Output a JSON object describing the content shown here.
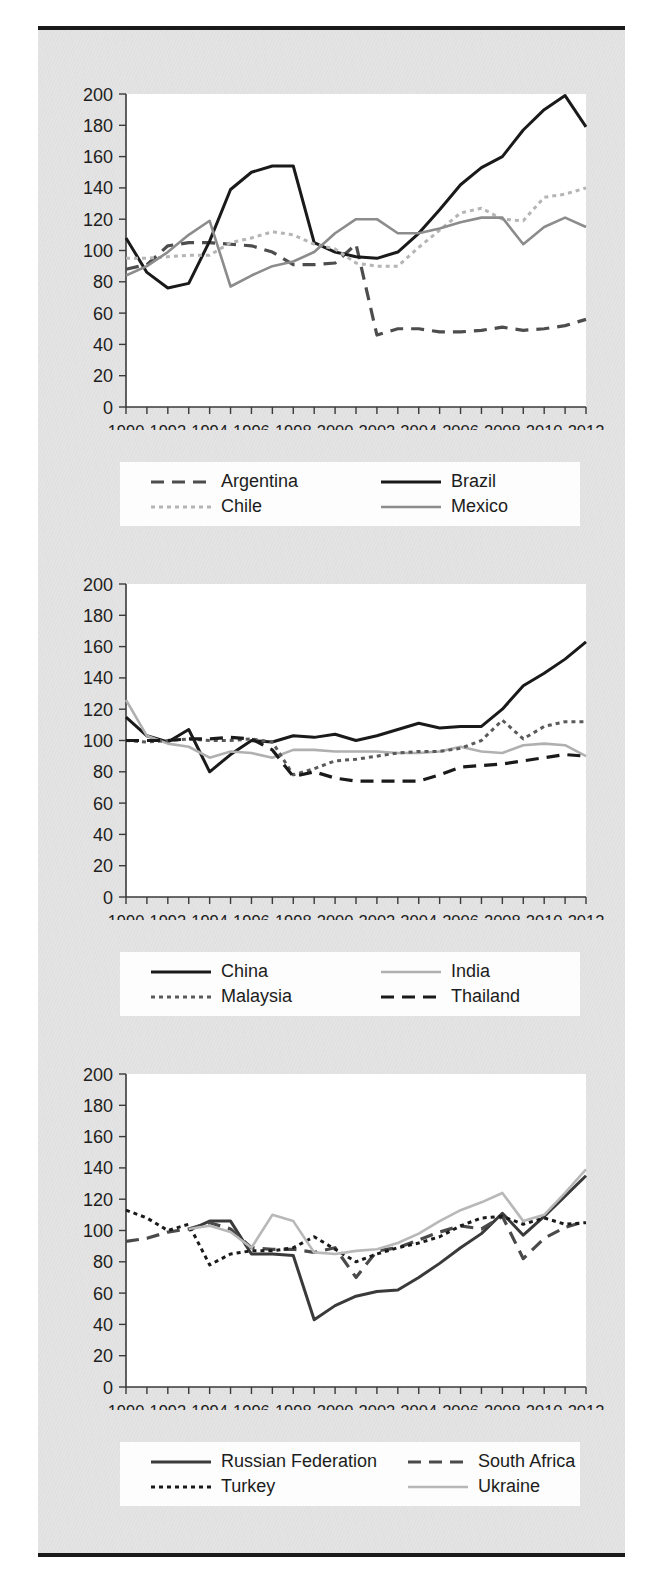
{
  "page": {
    "background_color": "#e3e3e3",
    "rule_color": "#1a1a1a"
  },
  "axis": {
    "y_ticks": [
      "0",
      "20",
      "40",
      "60",
      "80",
      "100",
      "120",
      "140",
      "160",
      "180",
      "200"
    ],
    "x_ticks": [
      "1990",
      "1992",
      "1994",
      "1996",
      "1998",
      "2000",
      "2002",
      "2004",
      "2006",
      "2008",
      "2010",
      "2012"
    ]
  },
  "charts": [
    {
      "id": "latin-america",
      "legend": [
        {
          "label": "Argentina",
          "style": "dashed",
          "color": "#4d4d4d"
        },
        {
          "label": "Brazil",
          "style": "solid",
          "color": "#1a1a1a"
        },
        {
          "label": "Chile",
          "style": "dotted",
          "color": "#b5b5b5"
        },
        {
          "label": "Mexico",
          "style": "solid-grey",
          "color": "#8c8c8c"
        }
      ]
    },
    {
      "id": "asia",
      "legend": [
        {
          "label": "China",
          "style": "solid",
          "color": "#1a1a1a"
        },
        {
          "label": "India",
          "style": "solid-grey",
          "color": "#b0b0b0"
        },
        {
          "label": "Malaysia",
          "style": "dotted",
          "color": "#5a5a5a"
        },
        {
          "label": "Thailand",
          "style": "dashed",
          "color": "#1a1a1a"
        }
      ]
    },
    {
      "id": "other-emerging",
      "legend": [
        {
          "label": "Russian Federation",
          "style": "solid",
          "color": "#3a3a3a"
        },
        {
          "label": "South Africa",
          "style": "dashed",
          "color": "#4a4a4a"
        },
        {
          "label": "Turkey",
          "style": "dotted",
          "color": "#1a1a1a"
        },
        {
          "label": "Ukraine",
          "style": "solid-grey",
          "color": "#b8b8b8"
        }
      ]
    }
  ],
  "chart_data": [
    {
      "type": "line",
      "title": "",
      "xlabel": "",
      "ylabel": "",
      "xlim": [
        1990,
        2012
      ],
      "ylim": [
        0,
        200
      ],
      "ytick_step": 20,
      "grid": false,
      "legend_position": "bottom",
      "x": [
        1990,
        1991,
        1992,
        1993,
        1994,
        1995,
        1996,
        1997,
        1998,
        1999,
        2000,
        2001,
        2002,
        2003,
        2004,
        2005,
        2006,
        2007,
        2008,
        2009,
        2010,
        2011,
        2012
      ],
      "series": [
        {
          "name": "Argentina",
          "style": "dashed",
          "color": "#4d4d4d",
          "values": [
            88,
            91,
            103,
            105,
            105,
            104,
            103,
            99,
            91,
            91,
            92,
            104,
            46,
            50,
            50,
            48,
            48,
            49,
            51,
            49,
            50,
            52,
            56
          ]
        },
        {
          "name": "Brazil",
          "style": "solid",
          "color": "#1a1a1a",
          "values": [
            108,
            86,
            76,
            79,
            106,
            139,
            150,
            154,
            154,
            105,
            99,
            96,
            95,
            99,
            111,
            126,
            142,
            153,
            160,
            177,
            190,
            199,
            179
          ]
        },
        {
          "name": "Chile",
          "style": "dotted",
          "color": "#b5b5b5",
          "values": [
            95,
            95,
            96,
            97,
            97,
            105,
            108,
            112,
            110,
            104,
            101,
            92,
            90,
            90,
            102,
            113,
            124,
            127,
            120,
            119,
            134,
            136,
            140
          ]
        },
        {
          "name": "Mexico",
          "style": "solid-grey",
          "color": "#8c8c8c",
          "values": [
            84,
            90,
            99,
            110,
            119,
            77,
            84,
            90,
            93,
            99,
            111,
            120,
            120,
            111,
            111,
            114,
            118,
            121,
            121,
            104,
            115,
            121,
            115
          ]
        }
      ]
    },
    {
      "type": "line",
      "title": "",
      "xlabel": "",
      "ylabel": "",
      "xlim": [
        1990,
        2012
      ],
      "ylim": [
        0,
        200
      ],
      "ytick_step": 20,
      "grid": false,
      "legend_position": "bottom",
      "x": [
        1990,
        1991,
        1992,
        1993,
        1994,
        1995,
        1996,
        1997,
        1998,
        1999,
        2000,
        2001,
        2002,
        2003,
        2004,
        2005,
        2006,
        2007,
        2008,
        2009,
        2010,
        2011,
        2012
      ],
      "series": [
        {
          "name": "China",
          "style": "solid",
          "color": "#1a1a1a",
          "values": [
            115,
            103,
            99,
            107,
            80,
            91,
            100,
            99,
            103,
            102,
            104,
            100,
            103,
            107,
            111,
            108,
            109,
            109,
            120,
            135,
            143,
            152,
            163
          ]
        },
        {
          "name": "India",
          "style": "solid-grey",
          "color": "#b0b0b0",
          "values": [
            126,
            103,
            98,
            96,
            89,
            93,
            92,
            89,
            94,
            94,
            93,
            93,
            93,
            92,
            92,
            93,
            96,
            93,
            92,
            97,
            98,
            97,
            90
          ]
        },
        {
          "name": "Malaysia",
          "style": "dotted",
          "color": "#5a5a5a",
          "values": [
            100,
            99,
            100,
            101,
            100,
            100,
            101,
            99,
            78,
            82,
            87,
            88,
            90,
            92,
            93,
            93,
            95,
            100,
            113,
            101,
            109,
            112,
            112
          ]
        },
        {
          "name": "Thailand",
          "style": "dashed",
          "color": "#1a1a1a",
          "values": [
            100,
            100,
            100,
            101,
            101,
            102,
            101,
            94,
            77,
            80,
            76,
            74,
            74,
            74,
            74,
            78,
            83,
            84,
            85,
            87,
            89,
            91,
            90
          ]
        }
      ]
    },
    {
      "type": "line",
      "title": "",
      "xlabel": "",
      "ylabel": "",
      "xlim": [
        1990,
        2012
      ],
      "ylim": [
        0,
        200
      ],
      "ytick_step": 20,
      "grid": false,
      "legend_position": "bottom",
      "x": [
        1990,
        1991,
        1992,
        1993,
        1994,
        1995,
        1996,
        1997,
        1998,
        1999,
        2000,
        2001,
        2002,
        2003,
        2004,
        2005,
        2006,
        2007,
        2008,
        2009,
        2010,
        2011,
        2012
      ],
      "series": [
        {
          "name": "Russian Federation",
          "style": "solid",
          "color": "#3a3a3a",
          "values": [
            null,
            null,
            null,
            100,
            106,
            106,
            85,
            85,
            84,
            43,
            52,
            58,
            61,
            62,
            70,
            79,
            89,
            98,
            111,
            97,
            109,
            122,
            135
          ]
        },
        {
          "name": "South Africa",
          "style": "dashed",
          "color": "#4a4a4a",
          "values": [
            93,
            95,
            99,
            101,
            105,
            101,
            89,
            88,
            88,
            86,
            89,
            70,
            87,
            89,
            94,
            99,
            103,
            101,
            109,
            82,
            95,
            102,
            106
          ]
        },
        {
          "name": "Turkey",
          "style": "dotted",
          "color": "#1a1a1a",
          "values": [
            113,
            108,
            100,
            104,
            78,
            85,
            87,
            87,
            89,
            96,
            88,
            80,
            85,
            89,
            92,
            96,
            103,
            108,
            109,
            104,
            108,
            104,
            105
          ]
        },
        {
          "name": "Ukraine",
          "style": "solid-grey",
          "color": "#b8b8b8",
          "values": [
            null,
            null,
            null,
            101,
            103,
            99,
            89,
            110,
            106,
            86,
            85,
            87,
            88,
            92,
            98,
            106,
            113,
            118,
            124,
            106,
            110,
            124,
            139
          ]
        }
      ]
    }
  ]
}
